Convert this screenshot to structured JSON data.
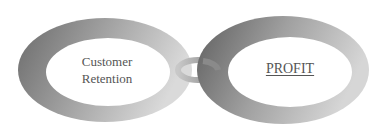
{
  "diagram": {
    "left_ring": {
      "label_line1": "Customer",
      "label_line2": "Retention"
    },
    "right_ring": {
      "label": "PROFIT"
    },
    "connector": "link",
    "colors": {
      "ring_dark": "#6e6e6e",
      "ring_light": "#d8d8d8",
      "text": "#555555",
      "background": "#ffffff"
    }
  }
}
